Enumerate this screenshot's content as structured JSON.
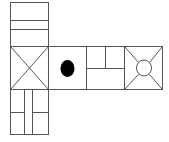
{
  "diagram": {
    "type": "cube-net",
    "background": "#ffffff",
    "stroke_color": "#555555",
    "fill_dark": "#000000",
    "faces": [
      {
        "id": "top",
        "pattern": "three-horizontal-bands"
      },
      {
        "id": "left",
        "pattern": "x-diagonals"
      },
      {
        "id": "front",
        "pattern": "black-dot"
      },
      {
        "id": "right",
        "pattern": "t-split-rectangles"
      },
      {
        "id": "back",
        "pattern": "circle-with-diagonals"
      },
      {
        "id": "bottom",
        "pattern": "vertical-split-grid"
      }
    ]
  }
}
